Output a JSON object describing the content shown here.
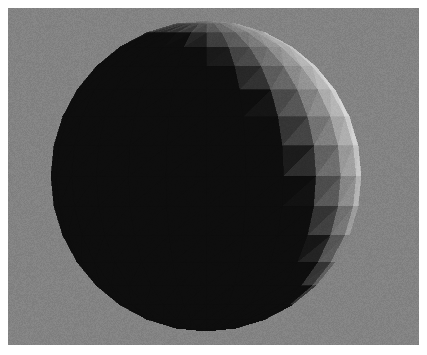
{
  "scene": {
    "title": "Flat-shaded 3D sphere render",
    "description": "A faceted sphere lit from the upper-left, rendered over a flat gray background inside a white border.",
    "image_width": 427,
    "image_height": 355,
    "border": {
      "name": "white-border",
      "color": "#ffffff",
      "width_px": 8
    },
    "background": {
      "name": "gray-backdrop",
      "color": "#7f7f7f",
      "x": 8,
      "y": 8,
      "width": 411,
      "height": 337
    },
    "noise": {
      "enabled": true,
      "amount": 0.16,
      "seed": 7
    }
  },
  "object": {
    "name": "sphere",
    "shading": "flat",
    "geometry": "uv-sphere",
    "latitude_segments": 16,
    "longitude_segments": 24,
    "triangles_per_quad": 2,
    "center_x": 198,
    "center_y": 168,
    "radius_px": 155,
    "base_color": "#ffffff"
  },
  "lighting": {
    "type": "directional",
    "direction": [
      -0.74,
      -0.4,
      0.54
    ],
    "ambient": 0.015,
    "diffuse": 1.0,
    "specular": 0.0,
    "gamma": 0.82,
    "highlight_screen_x": 66,
    "highlight_screen_y": 178,
    "terminator_screen_x": 268,
    "shadow_color": "#050505",
    "light_color": "#ffffff"
  },
  "camera": {
    "projection": "orthographic",
    "facing": "+z"
  },
  "chart_data": {
    "type": "scatter",
    "xlabel": "screen x (px)",
    "ylabel": "luminance (0-255)",
    "x": [
      66,
      100,
      135,
      170,
      200,
      232,
      265,
      300,
      330,
      352
    ],
    "values": [
      252,
      228,
      205,
      176,
      142,
      104,
      62,
      26,
      10,
      6
    ],
    "xlim": [
      43,
      353
    ],
    "ylim": [
      0,
      255
    ],
    "grid": false,
    "legend": "none"
  }
}
